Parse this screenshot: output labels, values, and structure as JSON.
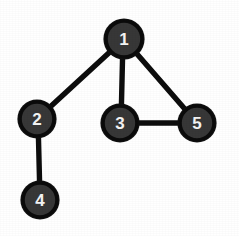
{
  "figure": {
    "background_color": "#ffffff",
    "width": 239,
    "height": 236
  },
  "style": {
    "node_fill": "#373737",
    "node_stroke": "#0b0b0b",
    "node_label_color": "#f4f4f4",
    "edge_color": "#0d0d0d",
    "edge_width": 5.4
  },
  "graph": {
    "type": "undirected-graph",
    "node_count": 5,
    "edge_count": 5,
    "nodes": [
      {
        "id": "1",
        "label": "1",
        "cx": 124,
        "cy": 39,
        "r": 19
      },
      {
        "id": "2",
        "label": "2",
        "cx": 37,
        "cy": 119,
        "r": 18
      },
      {
        "id": "3",
        "label": "3",
        "cx": 120,
        "cy": 123,
        "r": 18
      },
      {
        "id": "4",
        "label": "4",
        "cx": 40,
        "cy": 200,
        "r": 18
      },
      {
        "id": "5",
        "label": "5",
        "cx": 197,
        "cy": 123,
        "r": 18
      }
    ],
    "edges": [
      {
        "id": "edge-1-2",
        "source": "1",
        "target": "2",
        "x1": 124,
        "y1": 39,
        "x2": 37,
        "y2": 119
      },
      {
        "id": "edge-1-3",
        "source": "1",
        "target": "3",
        "x1": 123,
        "y1": 39,
        "x2": 121,
        "y2": 123
      },
      {
        "id": "edge-1-5",
        "source": "1",
        "target": "5",
        "x1": 124,
        "y1": 39,
        "x2": 197,
        "y2": 123
      },
      {
        "id": "edge-3-5",
        "source": "3",
        "target": "5",
        "x1": 120,
        "y1": 123,
        "x2": 197,
        "y2": 123
      },
      {
        "id": "edge-2-4",
        "source": "2",
        "target": "4",
        "x1": 38,
        "y1": 119,
        "x2": 40,
        "y2": 200
      }
    ]
  }
}
